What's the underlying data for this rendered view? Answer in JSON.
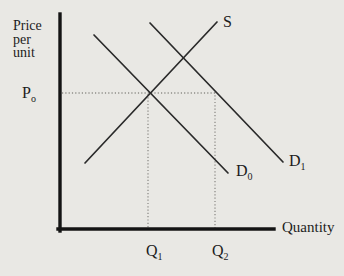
{
  "figure": {
    "background_color": "#e9e8e4",
    "ink_color": "#1c1c1c",
    "dotted_color": "#8e8d88"
  },
  "labels": {
    "y_axis_title_lines": [
      "Price",
      "per",
      "unit"
    ],
    "x_axis_title": "Quantity",
    "price_level": {
      "base": "P",
      "sub": "o"
    },
    "supply": "S",
    "demand_initial": {
      "base": "D",
      "sub": "0"
    },
    "demand_shifted": {
      "base": "D",
      "sub": "1"
    },
    "quantity_initial": {
      "base": "Q",
      "sub": "1"
    },
    "quantity_new": {
      "base": "Q",
      "sub": "2"
    }
  },
  "chart_data": {
    "type": "line",
    "xlabel": "Quantity",
    "ylabel": "Price per unit",
    "grid": false,
    "axis_tick_labels": {
      "y": [
        "Po"
      ],
      "x": [
        "Q1",
        "Q2"
      ]
    },
    "axes_px": [
      {
        "name": "y-axis",
        "from": [
          60,
          14
        ],
        "to": [
          60,
          231
        ]
      },
      {
        "name": "x-axis",
        "from": [
          58,
          229
        ],
        "to": [
          274,
          229
        ]
      }
    ],
    "series": [
      {
        "name": "S",
        "role": "supply-curve",
        "slope": "upward",
        "px_from": [
          85,
          163
        ],
        "px_to": [
          217,
          22
        ]
      },
      {
        "name": "D0",
        "role": "demand-curve-initial",
        "slope": "downward",
        "px_from": [
          94,
          35
        ],
        "px_to": [
          228,
          173
        ]
      },
      {
        "name": "D1",
        "role": "demand-curve-shifted",
        "slope": "downward",
        "px_from": [
          150,
          23
        ],
        "px_to": [
          283,
          162
        ]
      }
    ],
    "reference_lines": [
      {
        "name": "price-level-P0-dotted",
        "style": "dotted",
        "from": [
          62,
          93
        ],
        "to": [
          215,
          93
        ]
      },
      {
        "name": "quantity-Q1-dotted",
        "style": "dotted",
        "from": [
          148,
          94
        ],
        "to": [
          148,
          228
        ]
      },
      {
        "name": "quantity-Q2-dotted",
        "style": "dotted",
        "from": [
          215,
          92
        ],
        "to": [
          215,
          228
        ]
      }
    ],
    "marked_points": [
      {
        "point": "(Q1, Po)",
        "px": [
          148,
          93
        ],
        "meaning": "initial equilibrium: S intersects D0"
      },
      {
        "point": "(Q2, Po)",
        "px": [
          215,
          93
        ],
        "meaning": "quantity demanded on D1 at price Po"
      }
    ]
  }
}
